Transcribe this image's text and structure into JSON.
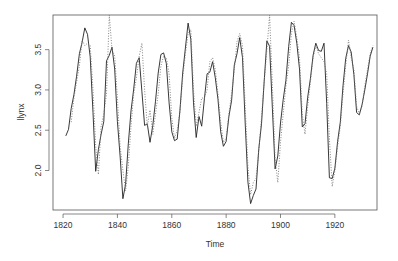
{
  "chart_data": {
    "type": "line",
    "title": "",
    "xlabel": "Time",
    "ylabel": "llynx",
    "xlim": [
      1816.3,
      1935.5
    ],
    "ylim": [
      1.51,
      3.93
    ],
    "grid": false,
    "legend": "none",
    "x_ticks": [
      1820,
      1840,
      1860,
      1880,
      1900,
      1920
    ],
    "x_tick_labels": [
      "1820",
      "1840",
      "1860",
      "1880",
      "1900",
      "1920"
    ],
    "y_ticks": [
      2.0,
      2.5,
      3.0,
      3.5
    ],
    "y_tick_labels": [
      "2.0",
      "2.5",
      "3.0",
      "3.5"
    ],
    "x_start": 1821,
    "series": [
      {
        "name": "observed",
        "style": "solid",
        "color": "#222222",
        "values": [
          2.43,
          2.51,
          2.77,
          2.94,
          3.17,
          3.45,
          3.59,
          3.77,
          3.69,
          3.41,
          2.72,
          1.99,
          2.26,
          2.45,
          2.61,
          3.36,
          3.43,
          3.53,
          3.26,
          2.61,
          2.18,
          1.65,
          1.83,
          2.33,
          2.74,
          3.01,
          3.33,
          3.4,
          2.98,
          2.56,
          2.58,
          2.35,
          2.56,
          2.86,
          3.21,
          3.44,
          3.46,
          3.33,
          2.84,
          2.48,
          2.37,
          2.39,
          2.74,
          3.21,
          3.52,
          3.83,
          3.63,
          2.84,
          2.41,
          2.67,
          2.55,
          2.89,
          3.2,
          3.22,
          3.35,
          3.15,
          2.88,
          2.48,
          2.3,
          2.36,
          2.67,
          2.87,
          3.31,
          3.45,
          3.65,
          3.4,
          2.59,
          1.86,
          1.59,
          1.69,
          1.77,
          2.27,
          2.58,
          3.11,
          3.61,
          3.54,
          2.77,
          2.02,
          2.18,
          2.59,
          2.88,
          3.12,
          3.54,
          3.84,
          3.8,
          3.58,
          3.26,
          2.54,
          2.58,
          2.91,
          3.14,
          3.43,
          3.58,
          3.49,
          3.48,
          3.58,
          2.83,
          1.91,
          1.9,
          2.03,
          2.36,
          2.6,
          3.05,
          3.39,
          3.55,
          3.47,
          3.19,
          2.72,
          2.69,
          2.82,
          3.0,
          3.2,
          3.42,
          3.53
        ]
      },
      {
        "name": "fitted",
        "style": "dotted",
        "color": "#777777",
        "values": [
          null,
          null,
          2.6,
          2.9,
          3.1,
          3.3,
          3.62,
          3.55,
          3.58,
          3.55,
          3.0,
          2.3,
          1.95,
          2.55,
          2.7,
          2.95,
          3.93,
          3.5,
          3.42,
          2.9,
          2.3,
          2.0,
          1.75,
          2.05,
          2.55,
          2.95,
          3.15,
          3.42,
          3.58,
          3.0,
          2.55,
          2.75,
          2.45,
          2.7,
          2.95,
          3.3,
          3.42,
          3.4,
          3.2,
          2.65,
          2.4,
          2.5,
          2.72,
          3.15,
          3.45,
          3.7,
          3.75,
          3.0,
          2.55,
          2.72,
          2.9,
          2.9,
          3.0,
          3.35,
          3.4,
          3.25,
          2.95,
          2.6,
          2.35,
          2.4,
          2.7,
          2.95,
          3.25,
          3.6,
          3.7,
          3.55,
          2.8,
          2.05,
          1.7,
          1.85,
          1.9,
          2.25,
          2.65,
          3.1,
          3.5,
          3.93,
          3.05,
          2.15,
          1.85,
          2.35,
          2.7,
          3.05,
          3.3,
          3.7,
          3.85,
          3.65,
          3.4,
          2.7,
          2.45,
          2.8,
          3.1,
          3.4,
          3.55,
          3.45,
          3.4,
          3.35,
          3.2,
          2.4,
          1.8,
          2.0,
          2.3,
          2.55,
          2.95,
          3.3,
          3.62,
          3.4,
          3.25,
          2.8,
          2.7,
          2.8,
          3.05,
          3.25,
          3.45,
          3.55
        ]
      }
    ]
  }
}
